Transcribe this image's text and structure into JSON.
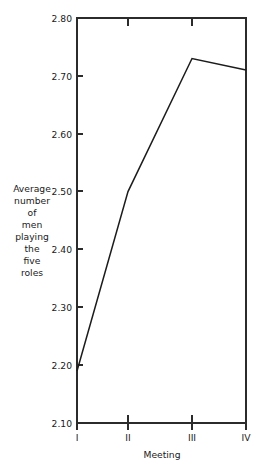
{
  "chart_data": {
    "type": "line",
    "title": "",
    "xlabel": "Meeting",
    "ylabel": "Average number of men playing the five roles",
    "ylabel_lines": [
      "Average",
      "number",
      "of",
      "men",
      "playing",
      "the",
      "five",
      "roles"
    ],
    "categories": [
      "I",
      "II",
      "III",
      "IV"
    ],
    "values": [
      2.19,
      2.5,
      2.73,
      2.71
    ],
    "series": [
      {
        "name": "Average number of men playing the five roles",
        "values": [
          2.19,
          2.5,
          2.73,
          2.71
        ]
      }
    ],
    "ylim": [
      2.1,
      2.8
    ],
    "ytick_labels": [
      "2.80",
      "2.70",
      "2.60",
      "2.50",
      "2.40",
      "2.30",
      "2.20",
      "2.10"
    ],
    "ytick_values": [
      2.8,
      2.7,
      2.6,
      2.5,
      2.4,
      2.3,
      2.2,
      2.1
    ],
    "xtick_labels": [
      "I",
      "II",
      "III",
      "IV"
    ],
    "grid": false,
    "legend": "none",
    "line_color": "#1c1c1c",
    "axis_color": "#2b2b2b",
    "background_color": "#ffffff"
  }
}
